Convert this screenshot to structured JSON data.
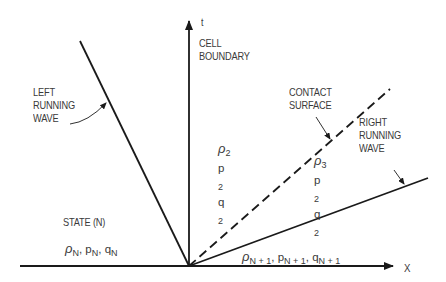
{
  "diagram": {
    "type": "riemann-wave-diagram",
    "axes": {
      "x_label": "X",
      "t_label": "t",
      "t_axis_caption": [
        "CELL",
        "BOUNDARY"
      ]
    },
    "lines": {
      "left_wave_label": [
        "LEFT",
        "RUNNING",
        "WAVE"
      ],
      "contact_surface_label": [
        "CONTACT",
        "SURFACE"
      ],
      "right_wave_label": [
        "RIGHT",
        "RUNNING",
        "WAVE"
      ]
    },
    "regions": {
      "left_state_title": "STATE (N)",
      "left_state_vars": {
        "rho": "ρ",
        "rho_sub": "N",
        "p": "p",
        "p_sub": "N",
        "q": "q",
        "q_sub": "N",
        "sep": ","
      },
      "region2": {
        "rho": "ρ",
        "rho_sub": "2",
        "p": "p",
        "p_sub": "2",
        "q": "q",
        "q_sub": "2"
      },
      "region3": {
        "rho": "ρ",
        "rho_sub": "3",
        "p": "p",
        "p_sub": "2",
        "q": "q",
        "q_sub": "2"
      },
      "right_state_vars": {
        "rho": "ρ",
        "rho_sub": "N + 1",
        "p": "p",
        "p_sub": "N + 1",
        "q": "q",
        "q_sub": "N + 1",
        "sep": ","
      }
    },
    "colors": {
      "line": "#1a1a1a",
      "text": "#3a3a3a",
      "background": "#ffffff"
    }
  }
}
